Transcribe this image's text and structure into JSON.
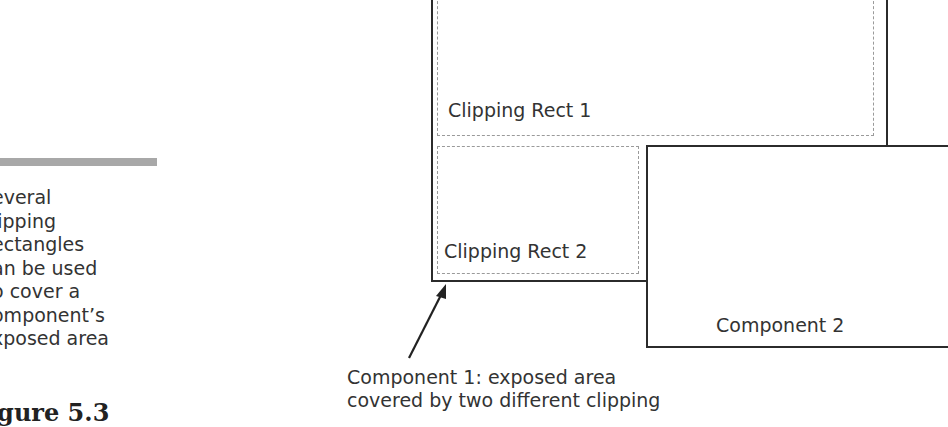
{
  "sidebar": {
    "lines": [
      "everal",
      "lipping",
      "ectangles",
      "an be used",
      "o cover a",
      "omponent’s",
      "xposed area"
    ],
    "figure_label": "igure 5.3"
  },
  "diagram": {
    "clipping_rect_1": "Clipping Rect 1",
    "clipping_rect_2": "Clipping Rect 2",
    "component_2": "Component  2",
    "caption_lines": [
      "Component  1: exposed area",
      "covered by two different clipping"
    ]
  },
  "colors": {
    "border": "#2b2b2b",
    "dashed": "#9a9a9a",
    "sidebar_bar": "#a8a8a8"
  }
}
